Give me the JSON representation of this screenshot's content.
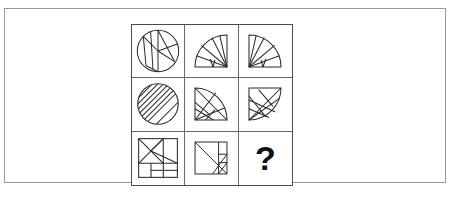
{
  "page": {
    "background_color": "#ffffff",
    "frame_border_color": "#9a9a9a",
    "grid_border_color": "#4a4a4a",
    "cell_divider_color": "#6a6a6a",
    "stroke_color": "#2b2b2b",
    "question_mark_color": "#111111"
  },
  "puzzle": {
    "type": "visual-analogy-matrix",
    "rows": 3,
    "columns": 3,
    "cells": [
      {
        "position": "row1-col1",
        "shape": "circle",
        "description": "Circle divided into wedge and strip segments by chords",
        "answer_slot": false
      },
      {
        "position": "row1-col2",
        "shape": "quarter-circle",
        "description": "Quarter disc with fan of radial lines, opening up-left",
        "answer_slot": false
      },
      {
        "position": "row1-col3",
        "shape": "quarter-circle",
        "description": "Quarter disc with fan of radial lines, mirrored",
        "answer_slot": false
      },
      {
        "position": "row2-col1",
        "shape": "circle",
        "description": "Circle filled with parallel diagonal hatch lines",
        "answer_slot": false
      },
      {
        "position": "row2-col2",
        "shape": "quarter-circle",
        "description": "Quarter disc with crossing chord lines, arc up-left",
        "answer_slot": false
      },
      {
        "position": "row2-col3",
        "shape": "quarter-circle",
        "description": "Quarter disc with crossing chord lines, arc up-right",
        "answer_slot": false
      },
      {
        "position": "row3-col1",
        "shape": "square",
        "description": "Square subdivided tangram-style into triangles and rectangles",
        "answer_slot": false
      },
      {
        "position": "row3-col2",
        "shape": "square",
        "description": "Square with diagonal and small corner subdivisions",
        "answer_slot": false
      },
      {
        "position": "row3-col3",
        "shape": "question-mark",
        "description": "Missing tile to be deduced",
        "label": "?",
        "answer_slot": true
      }
    ]
  }
}
